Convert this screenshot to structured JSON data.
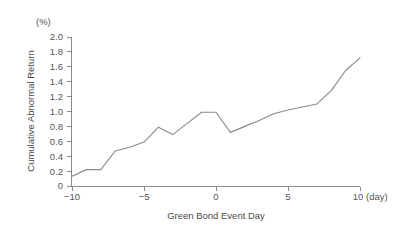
{
  "chart_data": {
    "type": "line",
    "title": "",
    "xlabel": "Green Bond Event Day",
    "ylabel": "Cumulative Abnormal Return",
    "y_unit_label": "(%)",
    "x_unit_label": "(day)",
    "grid": false,
    "legend": "none",
    "xlim": [
      -10,
      10
    ],
    "ylim": [
      0,
      2.0
    ],
    "x_ticks": [
      -10,
      -5,
      0,
      5,
      10
    ],
    "x_tick_labels": [
      "−10",
      "−5",
      "0",
      "5",
      "10"
    ],
    "y_ticks": [
      0,
      0.2,
      0.4,
      0.6,
      0.8,
      1.0,
      1.2,
      1.4,
      1.6,
      1.8,
      2.0
    ],
    "y_tick_labels": [
      "0",
      "0.2",
      "0.4",
      "0.6",
      "0.8",
      "1.0",
      "1.2",
      "1.4",
      "1.6",
      "1.8",
      "2.0"
    ],
    "x": [
      -10,
      -9,
      -8,
      -7,
      -6,
      -5,
      -4,
      -3,
      -2,
      -1,
      0,
      1,
      2,
      3,
      4,
      5,
      6,
      7,
      8,
      9,
      10
    ],
    "values": [
      0.13,
      0.22,
      0.22,
      0.47,
      0.52,
      0.59,
      0.79,
      0.69,
      0.84,
      0.99,
      0.99,
      0.72,
      0.8,
      0.88,
      0.97,
      1.02,
      1.06,
      1.1,
      1.28,
      1.55,
      1.72
    ],
    "series": [
      {
        "name": "Cumulative Abnormal Return",
        "color": "#8a8a8a",
        "values": [
          0.13,
          0.22,
          0.22,
          0.47,
          0.52,
          0.59,
          0.79,
          0.69,
          0.84,
          0.99,
          0.99,
          0.72,
          0.8,
          0.88,
          0.97,
          1.02,
          1.06,
          1.1,
          1.28,
          1.55,
          1.72
        ]
      }
    ]
  },
  "axis": {
    "y_title": "Cumulative Abnormal Return",
    "y_unit": "(%)",
    "x_title": "Green Bond Event Day",
    "x_unit": "(day)",
    "y_labels": {
      "t0": "0",
      "t1": "0.2",
      "t2": "0.4",
      "t3": "0.6",
      "t4": "0.8",
      "t5": "1.0",
      "t6": "1.2",
      "t7": "1.4",
      "t8": "1.6",
      "t9": "1.8",
      "t10": "2.0"
    },
    "x_labels": {
      "t0": "−10",
      "t1": "−5",
      "t2": "0",
      "t3": "5",
      "t4": "10"
    }
  },
  "colors": {
    "line": "#8a8a8a",
    "axis": "#808080",
    "text": "#4a4a4a",
    "background": "#ffffff"
  }
}
